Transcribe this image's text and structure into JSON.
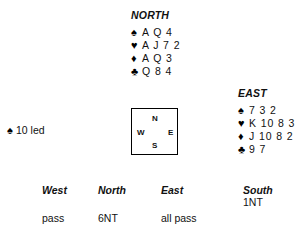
{
  "hands": {
    "north": {
      "label": "NORTH",
      "suits": [
        {
          "icon": "spade-icon",
          "symbol": "♠",
          "cards": "A Q 4"
        },
        {
          "icon": "heart-icon",
          "symbol": "♥",
          "cards": "A J 7 2"
        },
        {
          "icon": "diamond-icon",
          "symbol": "♦",
          "cards": "A Q 3"
        },
        {
          "icon": "club-icon",
          "symbol": "♣",
          "cards": "Q 8 4"
        }
      ]
    },
    "east": {
      "label": "EAST",
      "suits": [
        {
          "icon": "spade-icon",
          "symbol": "♠",
          "cards": "7 3 2"
        },
        {
          "icon": "heart-icon",
          "symbol": "♥",
          "cards": "K 10 8 3"
        },
        {
          "icon": "diamond-icon",
          "symbol": "♦",
          "cards": "J 10 8 2"
        },
        {
          "icon": "club-icon",
          "symbol": "♣",
          "cards": "9 7"
        }
      ]
    }
  },
  "lead": {
    "symbol": "♠",
    "text": "10 led"
  },
  "compass": {
    "north": "N",
    "west": "W",
    "east": "E",
    "south": "S"
  },
  "bidding": {
    "headers": [
      "West",
      "North",
      "East",
      "South"
    ],
    "rows": [
      [
        "",
        "",
        "",
        "1NT"
      ],
      [
        "pass",
        "6NT",
        "all pass",
        ""
      ]
    ]
  },
  "colors": {
    "ink": "#111111",
    "border": "#000000",
    "background": "#ffffff"
  }
}
